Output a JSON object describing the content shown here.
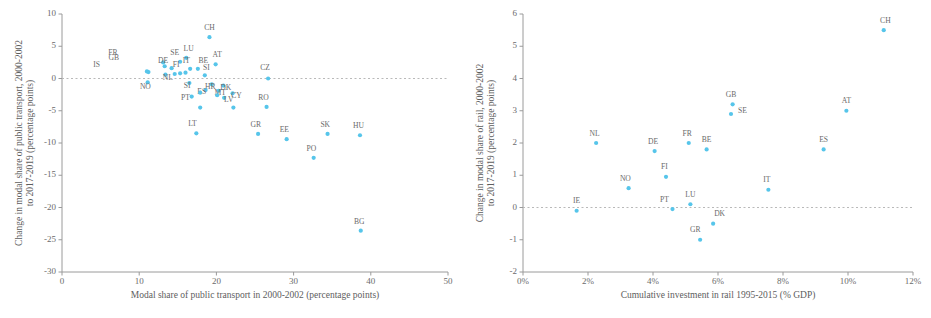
{
  "figure": {
    "marker_color": "#56c5ea",
    "axis_color": "#9a9a9a",
    "text_color": "#6b6b6b"
  },
  "chart_data": [
    {
      "id": "left",
      "type": "scatter",
      "title": "",
      "xlabel": "Modal share of public transport in 2000-2002  (percentage points)",
      "ylabel": "Change in modal share of public transport, 2000-2002 to 2017-2019 (percentage points)",
      "xlim": [
        0,
        50
      ],
      "ylim": [
        -30,
        10
      ],
      "xticks": [
        "0",
        "10",
        "20",
        "30",
        "40",
        "50"
      ],
      "xtickvals": [
        0,
        10,
        20,
        30,
        40,
        50
      ],
      "yticks": [
        "10",
        "5",
        "0",
        "-5",
        "-10",
        "-15",
        "-20",
        "-25",
        "-30"
      ],
      "ytickvals": [
        10,
        5,
        0,
        -5,
        -10,
        -15,
        -20,
        -25,
        -30
      ],
      "grid": false,
      "zero_line": true,
      "legend": "none",
      "points": [
        {
          "label": "CH",
          "x": 19.1,
          "y": 6.4,
          "lx": 0,
          "ly": -7
        },
        {
          "label": "FR",
          "x": 13.1,
          "y": 2.5,
          "lx": -6.5,
          "ly": -7
        },
        {
          "label": "LU",
          "x": 16.1,
          "y": 3.2,
          "lx": 0.3,
          "ly": -7
        },
        {
          "label": "SE",
          "x": 15.3,
          "y": 2.6,
          "lx": -0.7,
          "ly": -6.5
        },
        {
          "label": "GB",
          "x": 13.3,
          "y": 1.9,
          "lx": -6.6,
          "ly": -6.6
        },
        {
          "label": "AT",
          "x": 19.9,
          "y": 2.2,
          "lx": 0.2,
          "ly": -7.5
        },
        {
          "label": "DE",
          "x": 14.2,
          "y": 1.6,
          "lx": -1.1,
          "ly": -5.6
        },
        {
          "label": "IT",
          "x": 16.6,
          "y": 1.5,
          "lx": -0.5,
          "ly": -6.2
        },
        {
          "label": "BE",
          "x": 17.6,
          "y": 1.5,
          "lx": 0.7,
          "ly": -6.2
        },
        {
          "label": "IS",
          "x": 11.0,
          "y": 1.1,
          "lx": -6.5,
          "ly": -4.4
        },
        {
          "label": "FI",
          "x": 16.0,
          "y": 0.9,
          "lx": -1.2,
          "ly": -5.4
        },
        {
          "label": "CZ",
          "x": 26.7,
          "y": 0.0,
          "lx": -0.4,
          "ly": -8.4
        },
        {
          "label": "SI",
          "x": 18.5,
          "y": 0.5,
          "lx": 0.2,
          "ly": -5.4
        },
        {
          "label": "NO",
          "x": 11.1,
          "y": -0.6,
          "lx": -0.3,
          "ly": 6.6
        },
        {
          "label": "NL",
          "x": 13.4,
          "y": 0.6,
          "lx": 0.3,
          "ly": 5.6
        },
        {
          "label": "SI2",
          "x": 16.5,
          "y": -0.7,
          "lx": -0.3,
          "ly": 5.0
        },
        {
          "label": "HR",
          "x": 19.4,
          "y": -0.9,
          "lx": -0.2,
          "ly": 4.6
        },
        {
          "label": "DK",
          "x": 20.9,
          "y": -1.1,
          "lx": 0.3,
          "ly": 4.6
        },
        {
          "label": "ES",
          "x": 18.6,
          "y": -1.8,
          "lx": -0.5,
          "ly": 4.2
        },
        {
          "label": "MT",
          "x": 20.3,
          "y": -1.9,
          "lx": 0.2,
          "ly": 4.2
        },
        {
          "label": "CY",
          "x": 22.1,
          "y": -2.3,
          "lx": 0.5,
          "ly": 4.2
        },
        {
          "label": "PT",
          "x": 16.8,
          "y": -2.8,
          "lx": -0.8,
          "ly": 3.9
        },
        {
          "label": "LV",
          "x": 21.0,
          "y": -3.0,
          "lx": 0.6,
          "ly": 4.1
        },
        {
          "label": "RO",
          "x": 26.5,
          "y": -4.4,
          "lx": -0.4,
          "ly": -6.8
        },
        {
          "label": "LT",
          "x": 17.4,
          "y": -8.5,
          "lx": -0.5,
          "ly": -6.9
        },
        {
          "label": "GR",
          "x": 25.4,
          "y": -8.6,
          "lx": -0.3,
          "ly": -6.8
        },
        {
          "label": "EE",
          "x": 29.1,
          "y": -9.4,
          "lx": -0.3,
          "ly": -6.8
        },
        {
          "label": "SK",
          "x": 34.4,
          "y": -8.6,
          "lx": -0.3,
          "ly": -7.0
        },
        {
          "label": "HU",
          "x": 38.6,
          "y": -8.8,
          "lx": -0.2,
          "ly": -7.2
        },
        {
          "label": "PO",
          "x": 32.6,
          "y": -12.3,
          "lx": -0.3,
          "ly": -7.0
        },
        {
          "label": "BG",
          "x": 38.7,
          "y": -23.6,
          "lx": -0.2,
          "ly": -7.2
        },
        {
          "label": "",
          "x": 17.9,
          "y": -4.5,
          "lx": 0,
          "ly": 0
        },
        {
          "label": "",
          "x": 22.2,
          "y": -4.5,
          "lx": 0,
          "ly": 0
        },
        {
          "label": "",
          "x": 15.3,
          "y": 0.8,
          "lx": 0,
          "ly": 0
        },
        {
          "label": "",
          "x": 14.6,
          "y": 0.7,
          "lx": 0,
          "ly": 0
        },
        {
          "label": "",
          "x": 17.9,
          "y": -2.2,
          "lx": 0,
          "ly": 0
        },
        {
          "label": "",
          "x": 20.1,
          "y": -2.6,
          "lx": 0,
          "ly": 0
        },
        {
          "label": "",
          "x": 11.2,
          "y": 1.0,
          "lx": 0,
          "ly": 0
        }
      ]
    },
    {
      "id": "right",
      "type": "scatter",
      "title": "",
      "xlabel": "Cumulative  investment in rail 1995-2015 (% GDP)",
      "ylabel": "Change in modal share of rail, 2000-2002 to 2017-2019 (percentage points)",
      "xlim": [
        0,
        12
      ],
      "ylim": [
        -2,
        6
      ],
      "xticks": [
        "0%",
        "2%",
        "4%",
        "6%",
        "8%",
        "10%",
        "12%"
      ],
      "xtickvals": [
        0,
        2,
        4,
        6,
        8,
        10,
        12
      ],
      "yticks": [
        "6",
        "5",
        "4",
        "3",
        "2",
        "1",
        "0",
        "-1",
        "-2"
      ],
      "ytickvals": [
        6,
        5,
        4,
        3,
        2,
        1,
        0,
        -1,
        -2
      ],
      "grid": false,
      "zero_line": true,
      "legend": "none",
      "points": [
        {
          "label": "CH",
          "x": 11.1,
          "y": 5.5,
          "lx": 0.05,
          "ly": -7.5
        },
        {
          "label": "GB",
          "x": 6.45,
          "y": 3.2,
          "lx": -0.05,
          "ly": -7.5
        },
        {
          "label": "SE",
          "x": 6.4,
          "y": 2.9,
          "lx": 0.35,
          "ly": -0.5
        },
        {
          "label": "AT",
          "x": 9.95,
          "y": 3.0,
          "lx": 0.0,
          "ly": -7.5
        },
        {
          "label": "NL",
          "x": 2.25,
          "y": 2.0,
          "lx": -0.05,
          "ly": -7.5
        },
        {
          "label": "FR",
          "x": 5.1,
          "y": 2.0,
          "lx": -0.05,
          "ly": -7.5
        },
        {
          "label": "DE",
          "x": 4.05,
          "y": 1.75,
          "lx": -0.05,
          "ly": -7.5
        },
        {
          "label": "BE",
          "x": 5.65,
          "y": 1.8,
          "lx": 0.0,
          "ly": -7.5
        },
        {
          "label": "ES",
          "x": 9.25,
          "y": 1.8,
          "lx": 0.0,
          "ly": -7.5
        },
        {
          "label": "FI",
          "x": 4.4,
          "y": 0.95,
          "lx": -0.05,
          "ly": -7.5
        },
        {
          "label": "NO",
          "x": 3.25,
          "y": 0.6,
          "lx": -0.1,
          "ly": -7.5
        },
        {
          "label": "IT",
          "x": 7.55,
          "y": 0.55,
          "lx": -0.05,
          "ly": -7.5
        },
        {
          "label": "LU",
          "x": 5.15,
          "y": 0.1,
          "lx": 0.0,
          "ly": -7.5
        },
        {
          "label": "PT",
          "x": 4.6,
          "y": -0.05,
          "lx": -0.25,
          "ly": -7.5
        },
        {
          "label": "IE",
          "x": 1.65,
          "y": -0.1,
          "lx": 0.0,
          "ly": -7.5
        },
        {
          "label": "DK",
          "x": 5.85,
          "y": -0.5,
          "lx": 0.2,
          "ly": -7.5
        },
        {
          "label": "GR",
          "x": 5.45,
          "y": -1.0,
          "lx": -0.15,
          "ly": -7.5
        }
      ]
    }
  ]
}
